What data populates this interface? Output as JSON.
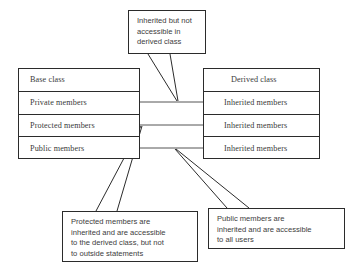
{
  "diagram": {
    "colors": {
      "background": "#ffffff",
      "stroke": "#2b2b2b",
      "connector": "#555555",
      "box_text": "#3a3a3a",
      "callout_text": "#3c3c3c"
    }
  },
  "base_class": {
    "header": "Base class",
    "rows": [
      {
        "label": "Private members"
      },
      {
        "label": "Protected members"
      },
      {
        "label": "Public members"
      }
    ]
  },
  "derived_class": {
    "header": "Derived class",
    "rows": [
      {
        "label": "Inherited members"
      },
      {
        "label": "Inherited members"
      },
      {
        "label": "Inherited members"
      }
    ]
  },
  "callouts": {
    "top": {
      "name": "inherited-not-accessible-callout",
      "lines": [
        "Inherited but not",
        "accessible in",
        "derived class"
      ]
    },
    "protected": {
      "name": "protected-members-callout",
      "lines": [
        "Protected members are",
        "inherited and are accessible",
        "to the derived class, but not",
        "to outside statements"
      ]
    },
    "public": {
      "name": "public-members-callout",
      "lines": [
        "Public members are",
        "inherited and are accessible",
        "to all users"
      ]
    }
  },
  "connectors": [
    {
      "name": "private-to-inherited-connector",
      "from": "Private members",
      "to": "Inherited members"
    },
    {
      "name": "protected-to-inherited-connector",
      "from": "Protected members",
      "to": "Inherited members"
    },
    {
      "name": "public-to-inherited-connector",
      "from": "Public members",
      "to": "Inherited members"
    }
  ]
}
